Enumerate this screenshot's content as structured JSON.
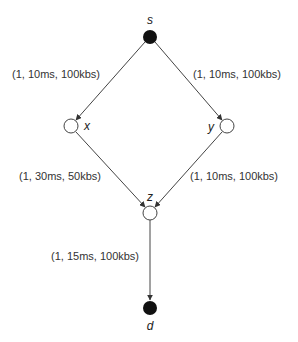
{
  "diagram": {
    "type": "network-graph",
    "colors": {
      "filled_node": "#111111",
      "open_node_stroke": "#444444",
      "edge": "#444444",
      "text": "#333333"
    },
    "nodes": [
      {
        "id": "s",
        "label": "s",
        "filled": true,
        "x": 150,
        "y": 37
      },
      {
        "id": "x",
        "label": "x",
        "filled": false,
        "x": 71,
        "y": 126
      },
      {
        "id": "y",
        "label": "y",
        "filled": false,
        "x": 227,
        "y": 126
      },
      {
        "id": "z",
        "label": "z",
        "filled": false,
        "x": 150,
        "y": 213
      },
      {
        "id": "d",
        "label": "d",
        "filled": true,
        "x": 150,
        "y": 308
      }
    ],
    "edges": [
      {
        "from": "s",
        "to": "x",
        "label": "(1, 10ms, 100kbs)"
      },
      {
        "from": "s",
        "to": "y",
        "label": "(1, 10ms, 100kbs)"
      },
      {
        "from": "x",
        "to": "z",
        "label": "(1, 30ms, 50kbs)"
      },
      {
        "from": "y",
        "to": "z",
        "label": "(1, 10ms, 100kbs)"
      },
      {
        "from": "z",
        "to": "d",
        "label": "(1, 15ms, 100kbs)"
      }
    ]
  }
}
